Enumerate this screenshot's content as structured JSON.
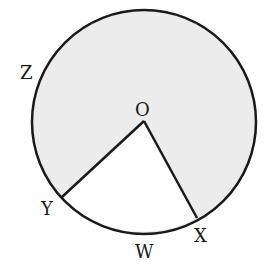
{
  "diagram": {
    "type": "circle-sector",
    "circle": {
      "cx": 144,
      "cy": 122,
      "r": 112,
      "fill": "#ececec",
      "stroke": "#1a1a1a"
    },
    "center": {
      "label": "O",
      "x": 144,
      "y": 121
    },
    "points": {
      "Y": {
        "label": "Y",
        "x": 62,
        "y": 197
      },
      "X": {
        "label": "X",
        "x": 197,
        "y": 218
      }
    },
    "labels": {
      "O": "O",
      "Z": "Z",
      "Y": "Y",
      "W": "W",
      "X": "X"
    },
    "unshaded_sector": "YOX (minor arc YWX)",
    "shaded_region": "major sector containing Z"
  }
}
